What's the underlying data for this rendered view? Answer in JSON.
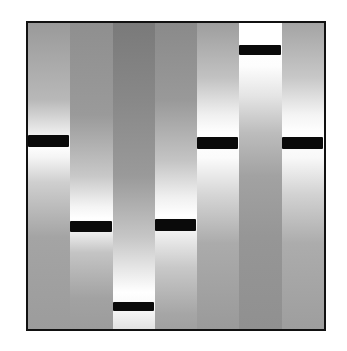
{
  "figure": {
    "type": "gel-electrophoresis",
    "frame_color": "#111111",
    "band_color": "#0a0a0a",
    "lane_count": 7
  },
  "lanes": [
    {
      "index": 1,
      "band_top": 112,
      "band_height": 12,
      "gradient": [
        "#9a9a9a 0%",
        "#b8b8b8 25%",
        "#f2f2f2 37%",
        "#ffffff 40%",
        "#f4f4f4 44%",
        "#cfcfcf 52%",
        "#a4a4a4 70%",
        "#9c9c9c 100%"
      ]
    },
    {
      "index": 2,
      "band_top": 198,
      "band_height": 11,
      "gradient": [
        "#8f8f8f 0%",
        "#9a9a9a 30%",
        "#c8c8c8 50%",
        "#f4f4f4 60%",
        "#ffffff 64%",
        "#f0f0f0 68%",
        "#c4c4c4 75%",
        "#a2a2a2 90%",
        "#9c9c9c 100%"
      ]
    },
    {
      "index": 3,
      "band_top": 279,
      "band_height": 9,
      "gradient": [
        "#7a7a7a 0%",
        "#888888 25%",
        "#9a9a9a 50%",
        "#c6c6c6 70%",
        "#f2f2f2 84%",
        "#ffffff 88%",
        "#f6f6f6 94%",
        "#e2e2e2 100%"
      ]
    },
    {
      "index": 4,
      "band_top": 196,
      "band_height": 12,
      "gradient": [
        "#8a8a8a 0%",
        "#999999 25%",
        "#c4c4c4 45%",
        "#f0f0f0 57%",
        "#ffffff 63%",
        "#f2f2f2 68%",
        "#c8c8c8 80%",
        "#a6a6a6 95%",
        "#a0a0a0 100%"
      ]
    },
    {
      "index": 5,
      "band_top": 114,
      "band_height": 12,
      "gradient": [
        "#9e9e9e 0%",
        "#c2c2c2 18%",
        "#f0f0f0 30%",
        "#ffffff 36%",
        "#fbfbfb 44%",
        "#d6d6d6 56%",
        "#ababab 72%",
        "#9a9a9a 100%"
      ]
    },
    {
      "index": 6,
      "band_top": 22,
      "band_height": 10,
      "gradient": [
        "#ffffff 0%",
        "#ffffff 6%",
        "#fdfdfd 14%",
        "#e4e4e4 24%",
        "#bcbcbc 36%",
        "#a2a2a2 50%",
        "#969696 70%",
        "#909090 100%"
      ]
    },
    {
      "index": 7,
      "band_top": 114,
      "band_height": 12,
      "gradient": [
        "#a4a4a4 0%",
        "#c8c8c8 18%",
        "#f4f4f4 30%",
        "#ffffff 36%",
        "#f8f8f8 44%",
        "#d2d2d2 56%",
        "#acacac 72%",
        "#9e9e9e 100%"
      ]
    }
  ]
}
